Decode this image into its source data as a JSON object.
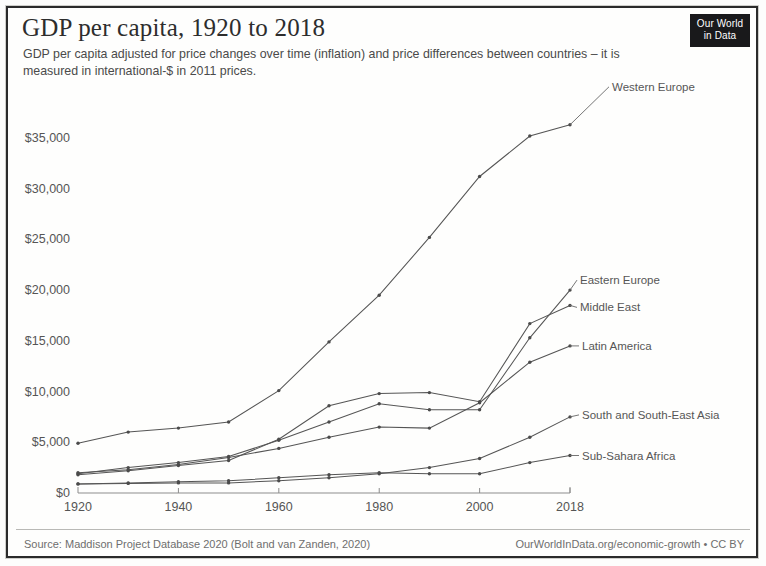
{
  "header": {
    "title": "GDP per capita, 1920 to 2018",
    "subtitle": "GDP per capita adjusted for price changes over time (inflation) and price differences between countries – it is measured in international-$ in 2011 prices."
  },
  "logo": {
    "line1": "Our World",
    "line2": "in Data"
  },
  "footer": {
    "source": "Source: Maddison Project Database 2020 (Bolt and van Zanden, 2020)",
    "credit": "OurWorldInData.org/economic-growth • CC BY"
  },
  "colors": {
    "ink": "#2d2d2d",
    "line": "#555555",
    "axis": "#8d8d8d",
    "logo_bg": "#19191b"
  },
  "chart_data": {
    "type": "line",
    "title": "GDP per capita, 1920 to 2018",
    "subtitle": "GDP per capita adjusted for price changes over time (inflation) and price differences between countries – it is measured in international-$ in 2011 prices.",
    "xlabel": "",
    "ylabel": "",
    "xlim": [
      1920,
      2018
    ],
    "ylim": [
      0,
      36500
    ],
    "grid": false,
    "legend": "right-inline-labels",
    "x_ticks": [
      1920,
      1940,
      1960,
      1980,
      2000,
      2018
    ],
    "x_tick_labels": [
      "1920",
      "1940",
      "1960",
      "1980",
      "2000",
      "2018"
    ],
    "y_ticks": [
      0,
      5000,
      10000,
      15000,
      20000,
      25000,
      30000,
      35000
    ],
    "y_tick_labels": [
      "$0",
      "$5,000",
      "$10,000",
      "$15,000",
      "$20,000",
      "$25,000",
      "$30,000",
      "$35,000"
    ],
    "x": [
      1920,
      1930,
      1940,
      1950,
      1960,
      1970,
      1980,
      1990,
      2000,
      2010,
      2018
    ],
    "series": [
      {
        "name": "Western Europe",
        "label": "Western Europe",
        "values": [
          4900,
          6000,
          6400,
          7000,
          10100,
          14900,
          19500,
          25200,
          31200,
          35200,
          36300
        ]
      },
      {
        "name": "Eastern Europe",
        "label": "Eastern Europe",
        "values": [
          1900,
          2500,
          3000,
          3600,
          5200,
          7000,
          8800,
          8200,
          8200,
          15300,
          20000
        ]
      },
      {
        "name": "Middle East",
        "label": "Middle East",
        "values": [
          1800,
          2200,
          2700,
          3200,
          5300,
          8600,
          9800,
          9900,
          9000,
          16700,
          18500
        ]
      },
      {
        "name": "Latin America",
        "label": "Latin America",
        "values": [
          2000,
          2300,
          2800,
          3500,
          4400,
          5500,
          6500,
          6400,
          8900,
          12900,
          14500
        ]
      },
      {
        "name": "South and South-East Asia",
        "label": "South and South-East Asia",
        "values": [
          900,
          950,
          1000,
          1000,
          1200,
          1500,
          1900,
          2500,
          3400,
          5500,
          7500
        ]
      },
      {
        "name": "Sub-Sahara Africa",
        "label": "Sub-Sahara Africa",
        "values": [
          900,
          1000,
          1100,
          1200,
          1500,
          1800,
          2000,
          1900,
          1900,
          3000,
          3700
        ]
      }
    ]
  }
}
